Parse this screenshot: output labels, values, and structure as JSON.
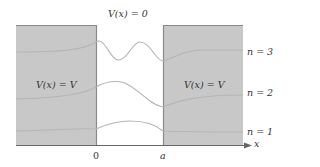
{
  "title_label": "V(x) = 0",
  "left_region_label": "V(x) = V",
  "right_region_label": "V(x) = V",
  "levels": [
    {
      "label": "n = 3",
      "n": 3
    },
    {
      "label": "n = 2",
      "n": 2
    },
    {
      "label": "n = 1",
      "n": 1
    }
  ],
  "axis": {
    "x_label": "x",
    "tick_zero": "0",
    "tick_a": "a"
  },
  "colors": {
    "barrier_fill": "#c8c8c8",
    "barrier_edge": "#8a8a8a",
    "wave": "#bdbdbd",
    "axis": "#666666"
  }
}
